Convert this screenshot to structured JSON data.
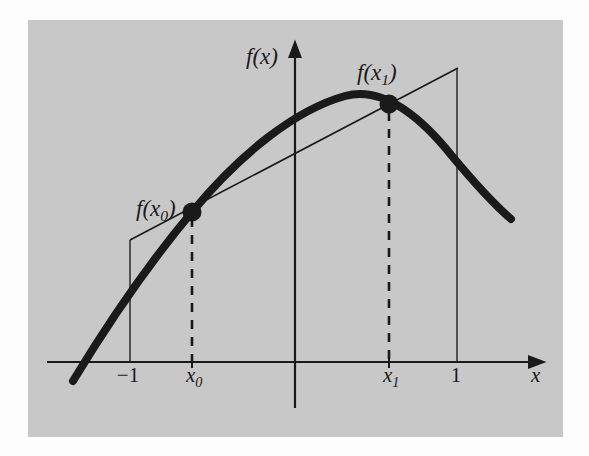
{
  "figure": {
    "background_color": "#ffffff",
    "panel_color": "#c8c8c8",
    "ink_color": "#1a1a1a",
    "panel": {
      "x": 28,
      "y": 20,
      "width": 535,
      "height": 417
    },
    "axes": {
      "x_axis_label": "x",
      "y_axis_label": "f(x)",
      "x_axis_y": 362,
      "y_axis_x": 295,
      "x_axis_start": 47,
      "x_axis_end": 537,
      "y_axis_top": 50,
      "y_axis_bottom": 408,
      "arrowheads": [
        "x-axis-right",
        "y-axis-top"
      ]
    },
    "ticks": [
      {
        "name": "minus-one",
        "label": "−1",
        "is_italic": false,
        "x": 130,
        "label_x": 128,
        "label_y": 381
      },
      {
        "name": "x0",
        "label": "x",
        "subscript": "0",
        "is_italic": true,
        "x": 192,
        "label_x": 193,
        "label_y": 381
      },
      {
        "name": "x1",
        "label": "x",
        "subscript": "1",
        "is_italic": true,
        "x": 389,
        "label_x": 390,
        "label_y": 381
      },
      {
        "name": "one",
        "label": "1",
        "is_italic": false,
        "x": 457,
        "label_x": 456,
        "label_y": 381
      }
    ],
    "points": [
      {
        "name": "point-x0",
        "label": "f(x",
        "subscript": "0",
        "label_close": ")",
        "x": 192,
        "y": 212,
        "radius": 9,
        "label_x": 136,
        "label_y": 216,
        "dashed_drop_to_y": 362
      },
      {
        "name": "point-x1",
        "label": "f(x",
        "subscript": "1",
        "label_close": ")",
        "x": 389,
        "y": 104,
        "radius": 9,
        "label_x": 357,
        "label_y": 80,
        "dashed_drop_to_y": 362
      }
    ],
    "secant_line": {
      "name": "secant-line",
      "x1": 130,
      "y1": 240,
      "x2": 458,
      "y2": 68,
      "stroke_width": 1.6
    },
    "vertical_guides": [
      {
        "name": "guide-minus-one",
        "x": 130,
        "y_top": 240,
        "y_bottom": 362
      },
      {
        "name": "guide-one",
        "x": 457,
        "y_top": 68,
        "y_bottom": 362
      }
    ],
    "curve": {
      "name": "function-curve",
      "stroke_width": 8,
      "description": "downward-opening parabola-like arc",
      "start": {
        "x": 73,
        "y": 381
      },
      "end": {
        "x": 511,
        "y": 219
      },
      "apex": {
        "x": 345,
        "y": 96
      },
      "path": "M 73 381 C 110 320, 150 262, 192 212 C 240 154, 295 110, 345 96 C 382 86, 420 116, 452 156 C 477 186, 497 207, 511 219"
    },
    "dash_pattern": "9 8"
  }
}
